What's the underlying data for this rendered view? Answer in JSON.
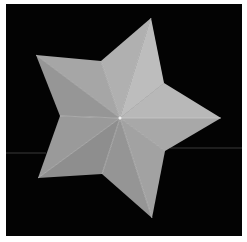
{
  "image": {
    "subject": "five-pointed gray faceted star on black background",
    "background_color": "#030303",
    "border_color": "#ffffff",
    "star": {
      "center": [
        120,
        118
      ],
      "outer_points": [
        [
          36,
          55
        ],
        [
          151,
          18
        ],
        [
          221,
          118
        ],
        [
          152,
          218
        ],
        [
          38,
          178
        ]
      ],
      "inner_points": [
        [
          101,
          61
        ],
        [
          164,
          83
        ],
        [
          165,
          151
        ],
        [
          102,
          174
        ],
        [
          60,
          116
        ]
      ],
      "facet_colors": {
        "light": "#b4b4b4",
        "mid": "#9c9c9c",
        "dark": "#888888"
      },
      "crease_color": "#d0d0d0"
    },
    "lines": [
      {
        "x1": 6,
        "y1": 153,
        "x2": 46,
        "y2": 153
      },
      {
        "x1": 170,
        "y1": 148,
        "x2": 242,
        "y2": 148
      }
    ]
  }
}
